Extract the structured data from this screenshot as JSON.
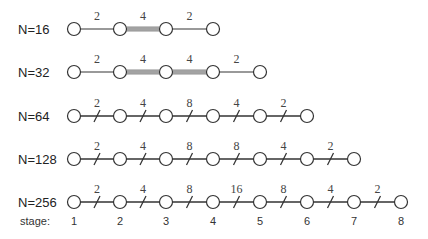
{
  "diagram": {
    "colors": {
      "line": "#333333",
      "thick_line": "#999999",
      "node_stroke": "#333333",
      "node_fill": "#ffffff"
    },
    "stage_x": [
      74,
      120,
      166,
      213,
      260,
      307,
      354,
      401
    ],
    "stage_label_prefix": "stage:",
    "stages": [
      "1",
      "2",
      "3",
      "4",
      "5",
      "6",
      "7",
      "8"
    ],
    "rows": [
      {
        "label": "N=16",
        "y": 29,
        "style": "thick",
        "edges": [
          "2",
          "4",
          "2"
        ]
      },
      {
        "label": "N=32",
        "y": 72,
        "style": "thick",
        "edges": [
          "2",
          "4",
          "4",
          "2"
        ]
      },
      {
        "label": "N=64",
        "y": 116,
        "style": "slash",
        "edges": [
          "2",
          "4",
          "8",
          "4",
          "2"
        ]
      },
      {
        "label": "N=128",
        "y": 159,
        "style": "slash",
        "edges": [
          "2",
          "4",
          "8",
          "8",
          "4",
          "2"
        ]
      },
      {
        "label": "N=256",
        "y": 202,
        "style": "slash",
        "edges": [
          "2",
          "4",
          "8",
          "16",
          "8",
          "4",
          "2"
        ]
      }
    ]
  }
}
